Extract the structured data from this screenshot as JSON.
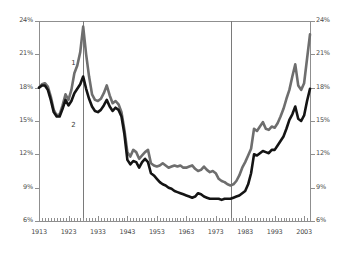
{
  "chart_data": {
    "type": "line",
    "title": "",
    "subtitle": "",
    "xlabel": "",
    "ylabel": "",
    "xlim": [
      1913,
      2005
    ],
    "ylim": [
      6,
      24
    ],
    "grid": false,
    "legend_position": "inline-annotation",
    "y_ticks": [
      "24%",
      "21%",
      "18%",
      "15%",
      "12%",
      "9%",
      "6%"
    ],
    "y_tick_values": [
      24,
      21,
      18,
      15,
      12,
      9,
      6
    ],
    "y_ticks_right": [
      "24%",
      "21%",
      "18%",
      "15%",
      "12%",
      "9%",
      "6%"
    ],
    "x_ticks": [
      "1913",
      "1923",
      "1933",
      "1943",
      "1953",
      "1963",
      "1973",
      "1983",
      "1993",
      "2003"
    ],
    "x_tick_values": [
      1913,
      1923,
      1933,
      1943,
      1953,
      1963,
      1973,
      1983,
      1993,
      2003
    ],
    "minor_tick_interval": 1,
    "annotations": [
      {
        "label": "1",
        "x": 1925,
        "y": 20.2,
        "series": "1"
      },
      {
        "label": "2",
        "x": 1925,
        "y": 14.6,
        "series": "2"
      }
    ],
    "reference_lines": [
      {
        "x": 1928,
        "color": "#7a7a7a"
      },
      {
        "x": 1978,
        "color": "#7a7a7a"
      }
    ],
    "colors": {
      "series_1": "#6e6e6e",
      "series_2": "#141414",
      "axis": "#8f8f8f",
      "text": "#4a4a4a"
    },
    "x": [
      1913,
      1914,
      1915,
      1916,
      1917,
      1918,
      1919,
      1920,
      1921,
      1922,
      1923,
      1924,
      1925,
      1926,
      1927,
      1928,
      1929,
      1930,
      1931,
      1932,
      1933,
      1934,
      1935,
      1936,
      1937,
      1938,
      1939,
      1940,
      1941,
      1942,
      1943,
      1944,
      1945,
      1946,
      1947,
      1948,
      1949,
      1950,
      1951,
      1952,
      1953,
      1954,
      1955,
      1956,
      1957,
      1958,
      1959,
      1960,
      1961,
      1962,
      1963,
      1964,
      1965,
      1966,
      1967,
      1968,
      1969,
      1970,
      1971,
      1972,
      1973,
      1974,
      1975,
      1976,
      1977,
      1978,
      1979,
      1980,
      1981,
      1982,
      1983,
      1984,
      1985,
      1986,
      1987,
      1988,
      1989,
      1990,
      1991,
      1992,
      1993,
      1994,
      1995,
      1996,
      1997,
      1998,
      1999,
      2000,
      2001,
      2002,
      2003,
      2004,
      2005
    ],
    "series": [
      {
        "name": "1",
        "label": "Top 10% income share including capital gains",
        "color": "#6e6e6e",
        "values": [
          18.0,
          18.3,
          18.4,
          18.1,
          17.2,
          16.0,
          15.5,
          15.6,
          16.4,
          17.4,
          16.9,
          17.8,
          19.3,
          20.0,
          21.2,
          23.5,
          21.0,
          19.0,
          17.4,
          16.9,
          16.8,
          17.0,
          17.5,
          18.2,
          17.3,
          16.6,
          16.8,
          16.5,
          15.8,
          14.2,
          12.2,
          11.8,
          12.4,
          12.2,
          11.6,
          11.9,
          12.2,
          12.4,
          11.2,
          11.0,
          10.9,
          11.0,
          11.2,
          11.0,
          10.8,
          10.9,
          11.0,
          10.9,
          11.0,
          10.8,
          10.8,
          10.9,
          11.0,
          10.7,
          10.5,
          10.6,
          10.9,
          10.6,
          10.4,
          10.5,
          10.3,
          9.8,
          9.6,
          9.5,
          9.3,
          9.2,
          9.3,
          9.6,
          10.1,
          10.8,
          11.3,
          11.9,
          12.5,
          14.3,
          14.1,
          14.5,
          14.9,
          14.3,
          14.2,
          14.5,
          14.4,
          14.8,
          15.4,
          16.1,
          17.0,
          17.8,
          19.0,
          20.1,
          18.2,
          17.8,
          18.4,
          20.6,
          22.8
        ]
      },
      {
        "name": "2",
        "label": "Top 10% income share excluding capital gains",
        "color": "#141414",
        "values": [
          18.0,
          18.2,
          18.2,
          17.8,
          16.9,
          15.8,
          15.4,
          15.4,
          16.1,
          16.9,
          16.4,
          16.8,
          17.5,
          17.9,
          18.3,
          19.0,
          17.9,
          17.0,
          16.3,
          15.9,
          15.8,
          16.0,
          16.4,
          16.9,
          16.3,
          15.9,
          16.2,
          16.0,
          15.4,
          13.8,
          11.5,
          11.1,
          11.4,
          11.3,
          10.8,
          11.3,
          11.6,
          11.3,
          10.3,
          10.1,
          9.8,
          9.5,
          9.3,
          9.2,
          9.0,
          8.9,
          8.7,
          8.6,
          8.5,
          8.4,
          8.3,
          8.2,
          8.1,
          8.2,
          8.5,
          8.4,
          8.2,
          8.1,
          8.0,
          8.0,
          8.0,
          8.0,
          7.9,
          8.0,
          8.0,
          8.0,
          8.1,
          8.2,
          8.3,
          8.5,
          8.7,
          9.3,
          10.3,
          12.0,
          11.9,
          12.1,
          12.3,
          12.2,
          12.1,
          12.4,
          12.4,
          12.8,
          13.2,
          13.6,
          14.3,
          15.1,
          15.6,
          16.3,
          15.2,
          15.0,
          15.5,
          16.8,
          17.9
        ]
      }
    ]
  }
}
